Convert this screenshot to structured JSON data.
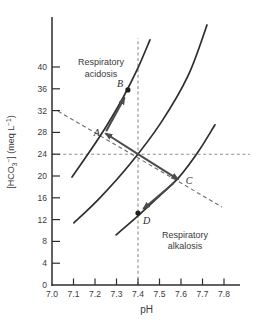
{
  "colors": {
    "background": "#ffffff",
    "axis": "#2e2e2e",
    "curve": "#2e2e2e",
    "arrow": "#4c4c4c",
    "reference_dash": "#8f8f8f",
    "buffer_dash": "#6e6e6e",
    "text": "#3a3a3a",
    "point": "#1f1f1f"
  },
  "chart_data": {
    "type": "line",
    "title": "",
    "xlabel": "pH",
    "ylabel": "[HCO3-] (meq L-1)",
    "ylabel_segments": [
      {
        "text": "[HCO",
        "style": "base"
      },
      {
        "text": "3",
        "style": "sub"
      },
      {
        "text": "−",
        "style": "sup"
      },
      {
        "text": "] (meq L",
        "style": "base"
      },
      {
        "text": "−1",
        "style": "sup"
      },
      {
        "text": ")",
        "style": "base"
      }
    ],
    "xlim": [
      7.0,
      7.88
    ],
    "ylim": [
      0,
      46
    ],
    "x_ticks": [
      7.0,
      7.1,
      7.2,
      7.3,
      7.4,
      7.5,
      7.6,
      7.7,
      7.8
    ],
    "y_ticks": [
      0,
      4,
      8,
      12,
      16,
      20,
      24,
      28,
      32,
      36,
      40
    ],
    "grid": false,
    "normal_point": {
      "x": 7.4,
      "y": 24
    },
    "reference_lines": [
      {
        "name": "normal-bicarbonate-line",
        "axis": "y",
        "value": 24,
        "from": 7.0,
        "to": 7.92
      },
      {
        "name": "normal-ph-line",
        "axis": "x",
        "value": 7.4,
        "from": 0,
        "to": 45.3
      }
    ],
    "buffer_line": {
      "name": "blood-buffer-line",
      "from": [
        7.028,
        31.9
      ],
      "to": [
        7.791,
        14.3
      ]
    },
    "curves": [
      {
        "name": "pco2-isopleth-high",
        "points": [
          [
            7.093,
            19.8
          ],
          [
            7.181,
            24.8
          ],
          [
            7.26,
            29.6
          ],
          [
            7.332,
            34.5
          ],
          [
            7.397,
            39.6
          ],
          [
            7.456,
            45.0
          ]
        ]
      },
      {
        "name": "pco2-isopleth-normal",
        "points": [
          [
            7.102,
            11.4
          ],
          [
            7.223,
            16.0
          ],
          [
            7.363,
            22.2
          ],
          [
            7.507,
            29.8
          ],
          [
            7.633,
            38.4
          ],
          [
            7.721,
            47.7
          ]
        ]
      },
      {
        "name": "pco2-isopleth-low",
        "points": [
          [
            7.298,
            9.2
          ],
          [
            7.395,
            12.5
          ],
          [
            7.493,
            16.1
          ],
          [
            7.591,
            19.8
          ],
          [
            7.679,
            24.4
          ],
          [
            7.758,
            29.4
          ]
        ]
      }
    ],
    "arrows": [
      {
        "name": "acute-respiratory-acidosis-arrow",
        "from": [
          7.4,
          24.0
        ],
        "to": [
          7.248,
          27.85
        ]
      },
      {
        "name": "acute-respiratory-alkalosis-arrow",
        "from": [
          7.4,
          24.0
        ],
        "to": [
          7.588,
          19.35
        ]
      },
      {
        "name": "compensation-arrow-a-to-b",
        "from": [
          7.252,
          28.2
        ],
        "to": [
          7.338,
          34.4
        ]
      },
      {
        "name": "compensation-arrow-c-to-d",
        "from": [
          7.566,
          18.7
        ],
        "to": [
          7.424,
          13.95
        ]
      }
    ],
    "points": [
      {
        "label": "A",
        "x": 7.245,
        "y": 27.9,
        "marker": "none",
        "label_dx": -11,
        "label_dy": 3
      },
      {
        "label": "B",
        "x": 7.353,
        "y": 35.8,
        "marker": "dot",
        "label_dx": -11,
        "label_dy": -3
      },
      {
        "label": "C",
        "x": 7.59,
        "y": 19.3,
        "marker": "none",
        "label_dx": 7,
        "label_dy": 4
      },
      {
        "label": "D",
        "x": 7.4,
        "y": 13.2,
        "marker": "dot",
        "label_dx": 5,
        "label_dy": 11
      }
    ],
    "annotations": [
      {
        "name": "respiratory-acidosis-label",
        "lines": [
          "Respiratory",
          "acidosis"
        ],
        "x": 7.228,
        "y": 40.0
      },
      {
        "name": "respiratory-alkalosis-label",
        "lines": [
          "Respiratory",
          "alkalosis"
        ],
        "x": 7.619,
        "y": 8.3
      }
    ]
  }
}
